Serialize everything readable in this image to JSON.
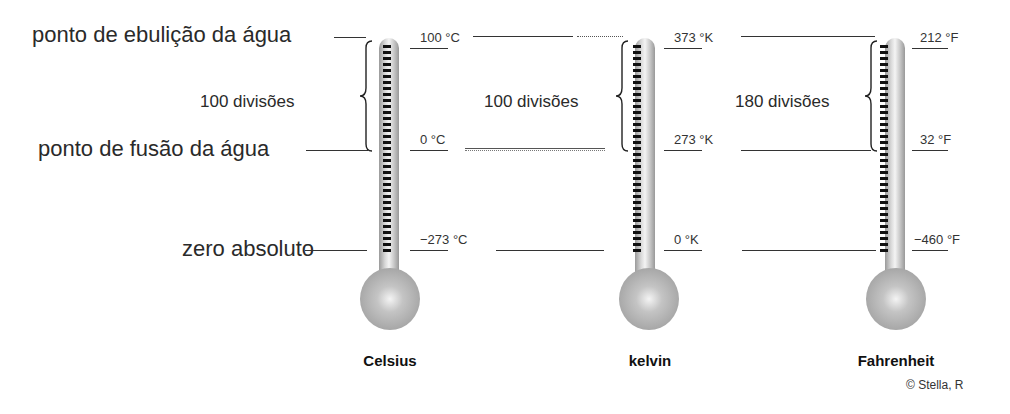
{
  "left_labels": {
    "boiling": "ponto de ebulição da água",
    "fusion": "ponto de fusão da água",
    "absolute_zero": "zero absoluto"
  },
  "scales": [
    {
      "name": "Celsius",
      "divisions": "100 divisões",
      "boiling": "100 °C",
      "fusion": "0 °C",
      "absolute_zero": "−273 °C"
    },
    {
      "name": "kelvin",
      "divisions": "100 divisões",
      "boiling": "373 °K",
      "fusion": "273 °K",
      "absolute_zero": "0 °K"
    },
    {
      "name": "Fahrenheit",
      "divisions": "180 divisões",
      "boiling": "212 °F",
      "fusion": "32 °F",
      "absolute_zero": "−460 °F"
    }
  ],
  "credit": "© Stella, R",
  "colors": {
    "ink": "#222222",
    "tube_gray": "#c8c8c8",
    "bulb_gray": "#a8a8a8",
    "tick": "#111111"
  }
}
